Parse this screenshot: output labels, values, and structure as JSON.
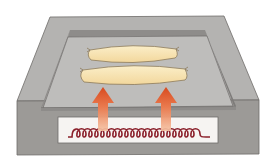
{
  "diagram": {
    "colors": {
      "background": "#ffffff",
      "top_surface": "#b4b3b1",
      "recess_floor": "#bebdbb",
      "recess_wall": "#8e8c8a",
      "front_face": "#9c9a97",
      "edge_line": "#6e6c6a",
      "window_fill": "#f6f4f2",
      "sausage_fill": "#f5dea8",
      "sausage_stroke": "#8b7a5a",
      "coil_color": "#8a1f2a",
      "arrow_top": "#d84a1e",
      "arrow_bottom": "#f6c3a4"
    },
    "sausages": [
      {
        "id": "sausage-top",
        "x1": 88,
        "x2": 178,
        "y": 54
      },
      {
        "id": "sausage-bottom",
        "x1": 80,
        "x2": 188,
        "y": 76
      }
    ],
    "heat_arrows": [
      {
        "id": "heat-arrow-left",
        "x": 103,
        "tip_y": 87,
        "base_y": 130
      },
      {
        "id": "heat-arrow-right",
        "x": 166,
        "tip_y": 87,
        "base_y": 130
      }
    ],
    "heating_coil": {
      "loops": 12,
      "x_start": 70,
      "x_end": 210,
      "baseline_y": 137
    }
  }
}
